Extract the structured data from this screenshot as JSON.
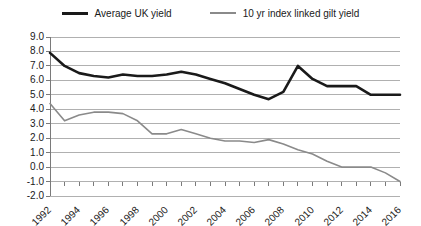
{
  "legend": {
    "position": "top-center",
    "entries": [
      {
        "label": "Average UK yield",
        "style": "thick",
        "color": "#1a1a1a"
      },
      {
        "label": "10 yr index linked gilt yield",
        "style": "thin",
        "color": "#8a8a8a"
      }
    ]
  },
  "chart_data": {
    "type": "line",
    "title": "",
    "subtitle": "",
    "xlabel": "",
    "ylabel": "",
    "x": [
      1992,
      1993,
      1994,
      1995,
      1996,
      1997,
      1998,
      1999,
      2000,
      2001,
      2002,
      2003,
      2004,
      2005,
      2006,
      2007,
      2008,
      2009,
      2010,
      2011,
      2012,
      2013,
      2014,
      2015,
      2016
    ],
    "xlim": [
      1992,
      2016
    ],
    "ylim": [
      -2.0,
      9.0
    ],
    "ytick_step": 1.0,
    "ytick_labels": [
      "9.0",
      "8.0",
      "7.0",
      "6.0",
      "5.0",
      "4.0",
      "3.0",
      "2.0",
      "1.0",
      "0.0",
      "-1.0",
      "-2.0"
    ],
    "ytick_values": [
      9.0,
      8.0,
      7.0,
      6.0,
      5.0,
      4.0,
      3.0,
      2.0,
      1.0,
      0.0,
      -1.0,
      -2.0
    ],
    "xtick_labels": [
      "1992",
      "1994",
      "1996",
      "1998",
      "2000",
      "2002",
      "2004",
      "2006",
      "2008",
      "2010",
      "2012",
      "2014",
      "2016"
    ],
    "xtick_values": [
      1992,
      1994,
      1996,
      1998,
      2000,
      2002,
      2004,
      2006,
      2008,
      2010,
      2012,
      2014,
      2016
    ],
    "xtick_label_rotation": -45,
    "grid": true,
    "grid_color": "#b0b0b0",
    "background": "#ffffff",
    "series": [
      {
        "name": "Average UK yield",
        "color": "#1a1a1a",
        "width": 2.6,
        "values": [
          7.9,
          7.0,
          6.5,
          6.3,
          6.2,
          6.4,
          6.3,
          6.3,
          6.4,
          6.6,
          6.4,
          6.1,
          5.8,
          5.4,
          5.0,
          4.7,
          5.2,
          7.0,
          6.1,
          5.6,
          5.6,
          5.6,
          5.0,
          5.0,
          5.0
        ]
      },
      {
        "name": "10 yr index linked gilt yield",
        "color": "#8a8a8a",
        "width": 1.6,
        "values": [
          4.4,
          3.2,
          3.6,
          3.8,
          3.8,
          3.7,
          3.2,
          2.3,
          2.3,
          2.6,
          2.3,
          2.0,
          1.8,
          1.8,
          1.7,
          1.9,
          1.6,
          1.2,
          0.9,
          0.4,
          0.0,
          0.0,
          0.0,
          -0.4,
          -1.0
        ]
      }
    ]
  }
}
